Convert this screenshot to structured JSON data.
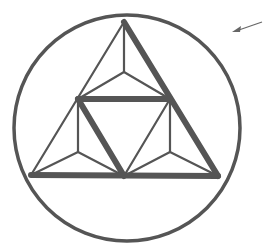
{
  "diagram": {
    "stroke_color": "#555555",
    "background": "#ffffff",
    "circle": {
      "cx": 127,
      "cy": 128,
      "r": 113,
      "stroke_width": 3.5
    },
    "thin_lines": [
      {
        "x1": 124,
        "y1": 22,
        "x2": 31,
        "y2": 175
      },
      {
        "x1": 124,
        "y1": 22,
        "x2": 124,
        "y2": 72
      },
      {
        "x1": 124,
        "y1": 72,
        "x2": 78,
        "y2": 99
      },
      {
        "x1": 124,
        "y1": 72,
        "x2": 170,
        "y2": 99
      },
      {
        "x1": 78,
        "y1": 99,
        "x2": 78,
        "y2": 152
      },
      {
        "x1": 78,
        "y1": 152,
        "x2": 31,
        "y2": 175
      },
      {
        "x1": 78,
        "y1": 152,
        "x2": 124,
        "y2": 176
      },
      {
        "x1": 170,
        "y1": 99,
        "x2": 170,
        "y2": 152
      },
      {
        "x1": 170,
        "y1": 152,
        "x2": 124,
        "y2": 176
      },
      {
        "x1": 170,
        "y1": 152,
        "x2": 218,
        "y2": 176
      },
      {
        "x1": 170,
        "y1": 99,
        "x2": 124,
        "y2": 176
      }
    ],
    "thick_lines": [
      {
        "x1": 124,
        "y1": 22,
        "x2": 218,
        "y2": 176
      },
      {
        "x1": 78,
        "y1": 99,
        "x2": 170,
        "y2": 99
      },
      {
        "x1": 78,
        "y1": 99,
        "x2": 124,
        "y2": 176
      },
      {
        "x1": 31,
        "y1": 175,
        "x2": 218,
        "y2": 176
      }
    ],
    "arrow": {
      "x1": 262,
      "y1": 22,
      "x2": 232,
      "y2": 32
    }
  }
}
